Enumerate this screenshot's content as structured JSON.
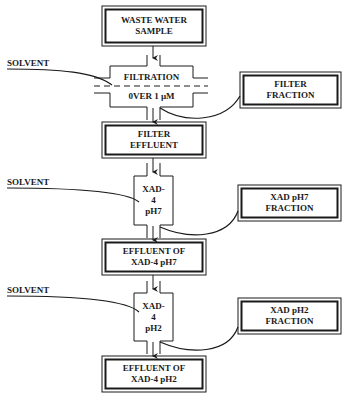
{
  "diagram": {
    "title": "",
    "colors": {
      "stroke": "#1a1a1a",
      "background": "#ffffff"
    },
    "nodes": {
      "waste_water_sample": {
        "line1": "WASTE WATER",
        "line2": "SAMPLE"
      },
      "filtration": {
        "line1": "FILTRATION",
        "line2": "0VER 1 µM"
      },
      "filter_fraction": {
        "line1": "FILTER",
        "line2": "FRACTION"
      },
      "filter_effluent": {
        "line1": "FILTER",
        "line2": "EFFLUENT"
      },
      "xad4_ph7_column": {
        "line1": "XAD-",
        "line2": "4",
        "line3": "pH7"
      },
      "xad_ph7_fraction": {
        "line1": "XAD pH7",
        "line2": "FRACTION"
      },
      "effluent_xad4_ph7": {
        "line1": "EFFLUENT OF",
        "line2": "XAD-4 pH7"
      },
      "xad4_ph2_column": {
        "line1": "XAD-",
        "line2": "4",
        "line3": "pH2"
      },
      "xad_ph2_fraction": {
        "line1": "XAD pH2",
        "line2": "FRACTION"
      },
      "effluent_xad4_ph2": {
        "line1": "EFFLUENT OF",
        "line2": "XAD-4 pH2"
      }
    },
    "solvent_inputs": [
      {
        "label": "SOLVENT",
        "target": "filtration"
      },
      {
        "label": "SOLVENT",
        "target": "xad4_ph7_column"
      },
      {
        "label": "SOLVENT",
        "target": "xad4_ph2_column"
      }
    ],
    "edges": [
      {
        "from": "waste_water_sample",
        "to": "filtration"
      },
      {
        "from": "filtration",
        "to": "filter_effluent"
      },
      {
        "from": "filtration",
        "to": "filter_fraction"
      },
      {
        "from": "filter_effluent",
        "to": "xad4_ph7_column"
      },
      {
        "from": "xad4_ph7_column",
        "to": "effluent_xad4_ph7"
      },
      {
        "from": "xad4_ph7_column",
        "to": "xad_ph7_fraction"
      },
      {
        "from": "effluent_xad4_ph7",
        "to": "xad4_ph2_column"
      },
      {
        "from": "xad4_ph2_column",
        "to": "effluent_xad4_ph2"
      },
      {
        "from": "xad4_ph2_column",
        "to": "xad_ph2_fraction"
      }
    ]
  }
}
